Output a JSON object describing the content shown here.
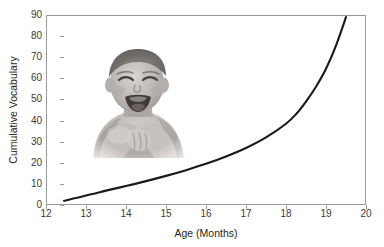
{
  "chart_data": {
    "type": "line",
    "title": "",
    "xlabel": "Age (Months)",
    "ylabel": "Cumulative Vocabulary",
    "xlim": [
      12,
      20
    ],
    "ylim": [
      0,
      90
    ],
    "xticks": [
      12,
      13,
      14,
      15,
      16,
      17,
      18,
      19,
      20
    ],
    "xtick_labels": [
      "12",
      "13",
      "14",
      "15",
      "16",
      "17",
      "18",
      "19",
      "20"
    ],
    "yticks": [
      0,
      10,
      20,
      30,
      40,
      50,
      60,
      70,
      80,
      90
    ],
    "ytick_labels": [
      "0",
      "10",
      "20",
      "30",
      "40",
      "50",
      "60",
      "70",
      "80",
      "90"
    ],
    "grid": false,
    "legend": false,
    "legend_position": "none",
    "series": [
      {
        "name": "Cumulative Vocabulary",
        "color": "#1a1a1a",
        "line_width": 2.1,
        "x": [
          12.45,
          12.75,
          13.0,
          13.25,
          13.5,
          14.0,
          14.5,
          15.0,
          15.5,
          16.0,
          16.5,
          17.0,
          17.5,
          18.0,
          18.25,
          18.5,
          18.75,
          19.0,
          19.25,
          19.5
        ],
        "y": [
          2.0,
          3.3,
          4.5,
          5.6,
          6.8,
          9.0,
          11.3,
          13.8,
          16.5,
          19.5,
          23.0,
          27.0,
          32.0,
          38.5,
          43.0,
          49.0,
          56.0,
          64.5,
          75.5,
          89.0
        ]
      }
    ],
    "annotations": [
      {
        "type": "image",
        "name": "baby-photo",
        "description": "Grayscale photograph of a laughing infant, shoulders up, hands near chest",
        "x_range": [
          12.98,
          15.63
        ],
        "y_range": [
          22.2,
          75.8
        ]
      }
    ]
  },
  "axes": {
    "y_title": "Cumulative Vocabulary",
    "x_title": "Age (Months)"
  },
  "colors": {
    "curve": "#1a1a1a",
    "frame": "#9a9a9a",
    "text": "#231f20",
    "tick_text": "#3a3a3a",
    "background": "#ffffff"
  }
}
